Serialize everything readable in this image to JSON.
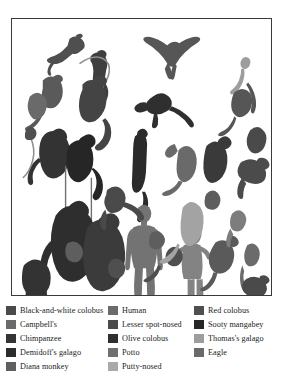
{
  "figure": {
    "panel": {
      "background_color": "#ffffff",
      "border_color": "#3a3a3a",
      "description": "Silhouette scale plate of Taï Forest primates, a potto, a galago, an eagle, and two human figures"
    },
    "palette": {
      "darkest": "#262626",
      "very_dark": "#333333",
      "dark": "#3f3f3f",
      "mid_dark": "#4f4f4f",
      "mid": "#5e5e5e",
      "mid_light": "#6f6f6f",
      "light": "#8a8a8a",
      "lighter": "#9a9a9a",
      "lightest": "#b4b4b4"
    }
  },
  "legend": {
    "columns": [
      {
        "items": [
          {
            "label": "Black-and-white colobus",
            "color": "#4a4a4a"
          },
          {
            "label": "Campbell's",
            "color": "#6a6a6a"
          },
          {
            "label": "Chimpanzee",
            "color": "#353535"
          },
          {
            "label": "Demidoff's galago",
            "color": "#2c2c2c"
          },
          {
            "label": "Diana monkey",
            "color": "#5f5f5f"
          }
        ]
      },
      {
        "items": [
          {
            "label": "Human",
            "color": "#6b6b6b"
          },
          {
            "label": "Lesser spot-nosed",
            "color": "#4b4b4b"
          },
          {
            "label": "Olive colobus",
            "color": "#2f2f2f"
          },
          {
            "label": "Potto",
            "color": "#6f6f6f"
          },
          {
            "label": "Putty-nosed",
            "color": "#a9a9a9"
          }
        ]
      },
      {
        "items": [
          {
            "label": "Red colobus",
            "color": "#4f4f4f"
          },
          {
            "label": "Sooty mangabey",
            "color": "#262626"
          },
          {
            "label": "Thomas's galago",
            "color": "#9d9d9d"
          },
          {
            "label": "Eagle",
            "color": "#6a6a6a"
          }
        ]
      }
    ]
  }
}
